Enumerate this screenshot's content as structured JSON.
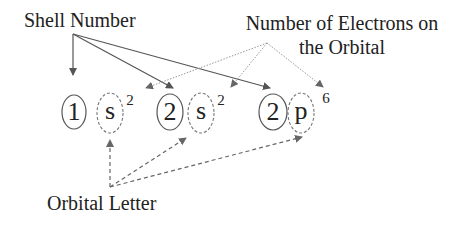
{
  "labels": {
    "shell_number": "Shell Number",
    "electrons_line1": "Number of Electrons on",
    "electrons_line2": "the Orbital",
    "orbital_letter": "Orbital Letter"
  },
  "configuration": [
    {
      "shell": "1",
      "orbital": "s",
      "electrons": "2"
    },
    {
      "shell": "2",
      "orbital": "s",
      "electrons": "2"
    },
    {
      "shell": "2",
      "orbital": "p",
      "electrons": "6"
    }
  ],
  "colors": {
    "text": "#222222",
    "solid_arrow": "#555555",
    "dotted_arrow": "#999999",
    "dashed_arrow": "#666666",
    "oval_stroke": "#555555",
    "dashed_oval_stroke": "#777777"
  }
}
